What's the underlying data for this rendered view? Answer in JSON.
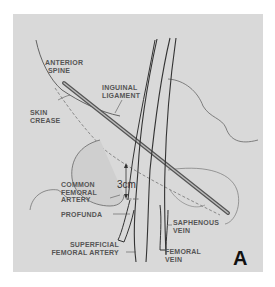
{
  "figure": {
    "panel_label": "A",
    "measurement": "3cm",
    "labels": {
      "anterior_spine": [
        "ANTERIOR",
        "SPINE"
      ],
      "inguinal_ligament": [
        "INGUINAL",
        "LIGAMENT"
      ],
      "skin_crease": [
        "SKIN",
        "CREASE"
      ],
      "common_femoral_artery": [
        "COMMON",
        "FEMORAL",
        "ARTERY"
      ],
      "profunda": [
        "PROFUNDA"
      ],
      "saphenous_vein": [
        "SAPHENOUS",
        "VEIN"
      ],
      "superficial_femoral_artery": [
        "SUPERFICIAL",
        "FEMORAL ARTERY"
      ],
      "femoral_vein": [
        "FEMORAL",
        "VEIN"
      ]
    },
    "colors": {
      "background": "#d9d9d9",
      "line": "#444444",
      "label_text": "#555555"
    }
  }
}
